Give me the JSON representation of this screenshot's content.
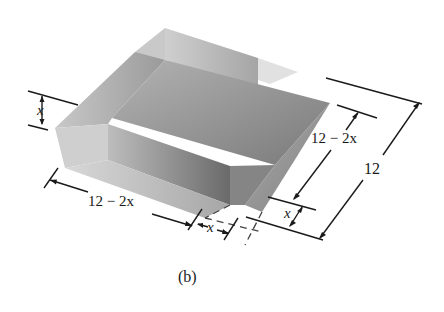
{
  "figure": {
    "caption": "(b)"
  },
  "labels": {
    "height_x": "x",
    "base_width": "12 − 2x",
    "base_width_var": "x",
    "corner_cut_x": "x",
    "side_12_minus_2x": "12 − 2x",
    "side_12_minus_2x_var": "x",
    "side_x_right": "x",
    "side_12": "12"
  },
  "colors": {
    "background": "#ffffff",
    "base_face": "#8e8e8e",
    "flap_light": "#c4c4c4",
    "flap_mid": "#a9a9a9",
    "flap_dark": "#6f6f6f",
    "back_wall": "#b8b8b8",
    "ink": "#1a1a1a"
  }
}
